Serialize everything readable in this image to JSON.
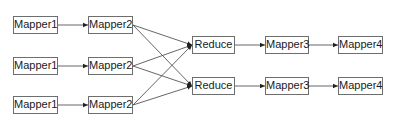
{
  "diagram": {
    "type": "flowchart",
    "background": "#ffffff",
    "line_color": "#555555",
    "border_color": "#6e6e6e",
    "nodes": [
      {
        "id": "m1a",
        "label": "Mapper1",
        "x": 13,
        "y": 16,
        "w": 45,
        "h": 18
      },
      {
        "id": "m1b",
        "label": "Mapper1",
        "x": 13,
        "y": 57,
        "w": 45,
        "h": 18
      },
      {
        "id": "m1c",
        "label": "Mapper1",
        "x": 13,
        "y": 96,
        "w": 45,
        "h": 18
      },
      {
        "id": "m2a",
        "label": "Mapper2",
        "x": 88,
        "y": 16,
        "w": 45,
        "h": 18
      },
      {
        "id": "m2b",
        "label": "Mapper2",
        "x": 88,
        "y": 57,
        "w": 45,
        "h": 18
      },
      {
        "id": "m2c",
        "label": "Mapper2",
        "x": 88,
        "y": 96,
        "w": 45,
        "h": 18
      },
      {
        "id": "ra",
        "label": "Reduce",
        "x": 192,
        "y": 36,
        "w": 43,
        "h": 18
      },
      {
        "id": "rb",
        "label": "Reduce",
        "x": 192,
        "y": 77,
        "w": 43,
        "h": 18
      },
      {
        "id": "m3a",
        "label": "Mapper3",
        "x": 265,
        "y": 36,
        "w": 44,
        "h": 18
      },
      {
        "id": "m3b",
        "label": "Mapper3",
        "x": 265,
        "y": 77,
        "w": 44,
        "h": 18
      },
      {
        "id": "m4a",
        "label": "Mapper4",
        "x": 338,
        "y": 36,
        "w": 45,
        "h": 18
      },
      {
        "id": "m4b",
        "label": "Mapper4",
        "x": 338,
        "y": 77,
        "w": 45,
        "h": 18
      }
    ],
    "edges": [
      {
        "from": "m1a",
        "to": "m2a"
      },
      {
        "from": "m1b",
        "to": "m2b"
      },
      {
        "from": "m1c",
        "to": "m2c"
      },
      {
        "from": "m2a",
        "to": "ra"
      },
      {
        "from": "m2a",
        "to": "rb"
      },
      {
        "from": "m2b",
        "to": "ra"
      },
      {
        "from": "m2b",
        "to": "rb"
      },
      {
        "from": "m2c",
        "to": "ra"
      },
      {
        "from": "m2c",
        "to": "rb"
      },
      {
        "from": "ra",
        "to": "m3a"
      },
      {
        "from": "rb",
        "to": "m3b"
      },
      {
        "from": "m3a",
        "to": "m4a"
      },
      {
        "from": "m3b",
        "to": "m4b"
      }
    ]
  }
}
